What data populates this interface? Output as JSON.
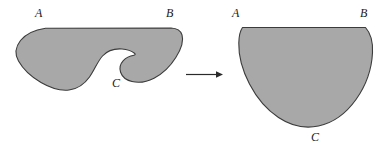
{
  "figure": {
    "background_color": "#ffffff",
    "fill_color": "#a8a8a8",
    "stroke_color": "#3b3b3b",
    "label_color": "#1a1a1a"
  },
  "left_shape": {
    "name": "irregular-notched-region",
    "labels": {
      "a": "A",
      "b": "B",
      "c": "C"
    }
  },
  "arrow": {
    "symbol": "→",
    "direction": "right"
  },
  "right_shape": {
    "name": "half-disk-region",
    "labels": {
      "a": "A",
      "b": "B",
      "c": "C"
    }
  }
}
